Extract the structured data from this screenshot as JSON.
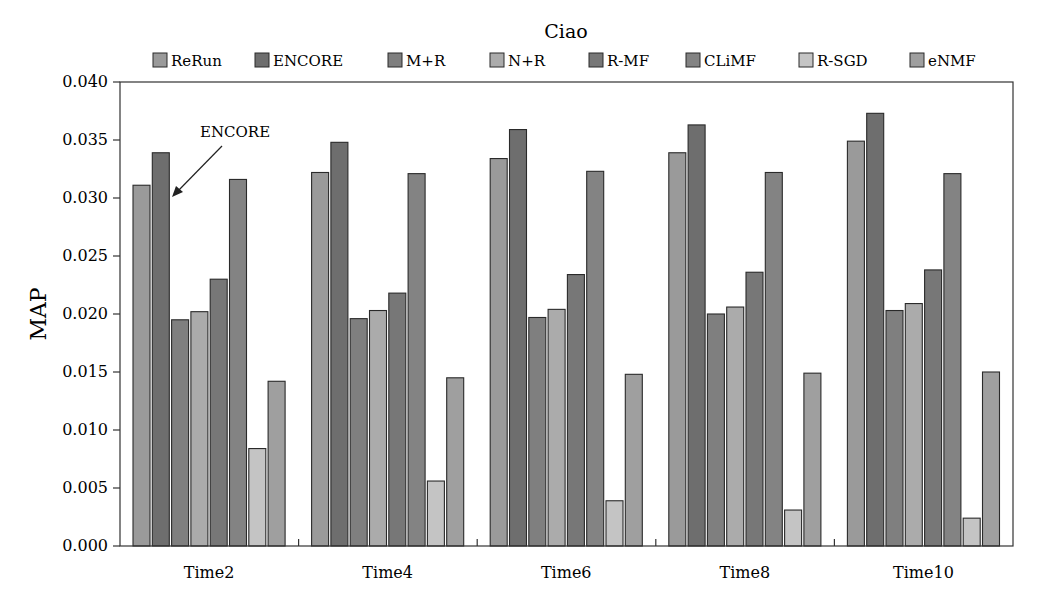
{
  "chart_data": {
    "type": "bar",
    "title": "Ciao",
    "xlabel": "",
    "ylabel": "MAP",
    "ylim": [
      0,
      0.04
    ],
    "yticks": [
      "0.000",
      "0.005",
      "0.010",
      "0.015",
      "0.020",
      "0.025",
      "0.030",
      "0.035",
      "0.040"
    ],
    "grid": false,
    "legend_position": "top",
    "categories": [
      "Time2",
      "Time4",
      "Time6",
      "Time8",
      "Time10"
    ],
    "series": [
      {
        "name": "ReRun",
        "color": "#9a9a9a",
        "values": [
          0.0311,
          0.0322,
          0.0334,
          0.0339,
          0.0349
        ]
      },
      {
        "name": "ENCORE",
        "color": "#6e6e6e",
        "values": [
          0.0339,
          0.0348,
          0.0359,
          0.0363,
          0.0373
        ]
      },
      {
        "name": "M+R",
        "color": "#7f7f7f",
        "values": [
          0.0195,
          0.0196,
          0.0197,
          0.02,
          0.0203
        ]
      },
      {
        "name": "N+R",
        "color": "#ababab",
        "values": [
          0.0202,
          0.0203,
          0.0204,
          0.0206,
          0.0209
        ]
      },
      {
        "name": "R-MF",
        "color": "#777777",
        "values": [
          0.023,
          0.0218,
          0.0234,
          0.0236,
          0.0238
        ]
      },
      {
        "name": "CLiMF",
        "color": "#838383",
        "values": [
          0.0316,
          0.0321,
          0.0323,
          0.0322,
          0.0321
        ]
      },
      {
        "name": "R-SGD",
        "color": "#c4c4c4",
        "values": [
          0.0084,
          0.0056,
          0.0039,
          0.0031,
          0.0024
        ]
      },
      {
        "name": "eNMF",
        "color": "#9f9f9f",
        "values": [
          0.0142,
          0.0145,
          0.0148,
          0.0149,
          0.015
        ]
      }
    ],
    "annotations": [
      {
        "text": "ENCORE",
        "target_series": "ENCORE",
        "target_category": "Time2",
        "arrow": true
      }
    ]
  }
}
